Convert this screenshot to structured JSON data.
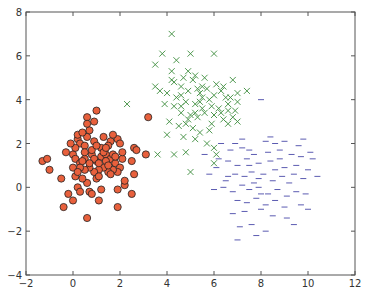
{
  "chart_data": {
    "type": "scatter",
    "title": "",
    "xlabel": "",
    "ylabel": "",
    "xlim": [
      -2,
      12
    ],
    "ylim": [
      -4,
      8
    ],
    "xticks": [
      -2,
      0,
      2,
      4,
      6,
      8,
      10,
      12
    ],
    "yticks": [
      -4,
      -2,
      0,
      2,
      4,
      6,
      8
    ],
    "xtick_labels": [
      "−2",
      "0",
      "2",
      "4",
      "6",
      "8",
      "10",
      "12"
    ],
    "ytick_labels": [
      "−4",
      "−2",
      "0",
      "2",
      "4",
      "6",
      "8"
    ],
    "grid": false,
    "legend": null,
    "series": [
      {
        "name": "cluster-1",
        "marker": "o",
        "color": "#e8603c",
        "edgecolor": "#222222",
        "points": [
          [
            -1.3,
            1.2
          ],
          [
            -1.1,
            1.3
          ],
          [
            -1.0,
            0.8
          ],
          [
            -0.5,
            0.4
          ],
          [
            -0.4,
            -0.9
          ],
          [
            -0.2,
            -0.3
          ],
          [
            0.0,
            -0.6
          ],
          [
            0.2,
            0.0
          ],
          [
            0.3,
            -0.2
          ],
          [
            0.1,
            0.5
          ],
          [
            0.6,
            0.2
          ],
          [
            0.7,
            -0.2
          ],
          [
            0.8,
            -0.3
          ],
          [
            1.1,
            -0.6
          ],
          [
            1.2,
            -0.1
          ],
          [
            0.6,
            -1.4
          ],
          [
            1.9,
            -0.1
          ],
          [
            1.9,
            -0.9
          ],
          [
            2.2,
            0.1
          ],
          [
            2.5,
            -0.3
          ],
          [
            2.2,
            0.3
          ],
          [
            2.6,
            0.6
          ],
          [
            0.0,
            1.5
          ],
          [
            0.1,
            1.3
          ],
          [
            0.3,
            1.1
          ],
          [
            0.5,
            1.3
          ],
          [
            0.8,
            1.5
          ],
          [
            1.0,
            1.2
          ],
          [
            1.2,
            1.4
          ],
          [
            1.4,
            1.5
          ],
          [
            1.6,
            1.3
          ],
          [
            1.8,
            1.1
          ],
          [
            2.0,
            0.9
          ],
          [
            1.9,
            0.7
          ],
          [
            1.7,
            0.8
          ],
          [
            1.5,
            0.7
          ],
          [
            1.3,
            0.9
          ],
          [
            1.1,
            0.8
          ],
          [
            0.9,
            0.7
          ],
          [
            0.7,
            0.9
          ],
          [
            0.5,
            0.8
          ],
          [
            0.3,
            0.9
          ],
          [
            0.0,
            0.9
          ],
          [
            0.2,
            0.7
          ],
          [
            0.4,
            0.4
          ],
          [
            1.0,
            0.4
          ],
          [
            1.1,
            0.5
          ],
          [
            1.6,
            0.6
          ],
          [
            2.5,
            1.2
          ],
          [
            2.1,
            1.3
          ],
          [
            0.2,
            2.2
          ],
          [
            0.3,
            2.0
          ],
          [
            0.5,
            1.9
          ],
          [
            0.6,
            2.3
          ],
          [
            0.9,
            2.1
          ],
          [
            1.3,
            2.3
          ],
          [
            1.6,
            2.1
          ],
          [
            1.9,
            2.2
          ],
          [
            2.0,
            2.0
          ],
          [
            1.5,
            1.9
          ],
          [
            1.2,
            1.8
          ],
          [
            0.8,
            1.7
          ],
          [
            0.5,
            1.6
          ],
          [
            0.1,
            1.8
          ],
          [
            -0.1,
            2.0
          ],
          [
            0.2,
            2.4
          ],
          [
            0.4,
            2.5
          ],
          [
            0.7,
            2.6
          ],
          [
            0.9,
            3.0
          ],
          [
            1.0,
            3.5
          ],
          [
            0.6,
            3.2
          ],
          [
            0.6,
            2.9
          ],
          [
            2.6,
            1.8
          ],
          [
            2.7,
            1.7
          ],
          [
            3.1,
            1.5
          ],
          [
            3.2,
            3.2
          ],
          [
            1.7,
            1.5
          ],
          [
            1.4,
            1.2
          ],
          [
            0.9,
            1.3
          ],
          [
            0.7,
            1.1
          ],
          [
            1.0,
            1.9
          ],
          [
            1.3,
            1.6
          ],
          [
            1.1,
            1.1
          ],
          [
            1.5,
            1.0
          ],
          [
            1.8,
            1.4
          ],
          [
            0.4,
            1.2
          ],
          [
            -0.3,
            1.6
          ],
          [
            1.7,
            2.4
          ],
          [
            2.1,
            1.6
          ],
          [
            1.4,
            1.8
          ]
        ]
      },
      {
        "name": "cluster-2",
        "marker": "x",
        "color": "#3c8c3c",
        "points": [
          [
            4.2,
            7.0
          ],
          [
            3.8,
            6.1
          ],
          [
            4.4,
            5.8
          ],
          [
            5.0,
            6.1
          ],
          [
            6.0,
            6.1
          ],
          [
            3.5,
            5.6
          ],
          [
            4.2,
            5.3
          ],
          [
            4.7,
            5.0
          ],
          [
            5.2,
            5.1
          ],
          [
            6.1,
            4.7
          ],
          [
            5.5,
            4.6
          ],
          [
            6.3,
            4.4
          ],
          [
            7.0,
            4.3
          ],
          [
            6.8,
            4.9
          ],
          [
            4.3,
            4.8
          ],
          [
            4.6,
            4.6
          ],
          [
            4.9,
            4.4
          ],
          [
            5.4,
            4.3
          ],
          [
            5.7,
            4.5
          ],
          [
            6.0,
            4.2
          ],
          [
            6.5,
            4.1
          ],
          [
            3.7,
            4.4
          ],
          [
            4.0,
            4.3
          ],
          [
            4.4,
            4.1
          ],
          [
            4.8,
            3.9
          ],
          [
            5.2,
            3.8
          ],
          [
            5.5,
            3.6
          ],
          [
            5.9,
            3.7
          ],
          [
            6.2,
            3.6
          ],
          [
            6.6,
            3.8
          ],
          [
            6.9,
            3.5
          ],
          [
            7.0,
            3.9
          ],
          [
            3.5,
            4.6
          ],
          [
            3.9,
            3.8
          ],
          [
            4.3,
            3.7
          ],
          [
            4.6,
            3.4
          ],
          [
            5.0,
            3.3
          ],
          [
            5.3,
            3.2
          ],
          [
            5.6,
            3.4
          ],
          [
            6.0,
            3.3
          ],
          [
            6.4,
            3.1
          ],
          [
            6.8,
            3.2
          ],
          [
            7.0,
            3.0
          ],
          [
            6.6,
            2.9
          ],
          [
            4.1,
            3.0
          ],
          [
            4.5,
            2.8
          ],
          [
            4.8,
            2.9
          ],
          [
            5.1,
            2.7
          ],
          [
            5.4,
            2.5
          ],
          [
            5.8,
            2.6
          ],
          [
            4.0,
            2.4
          ],
          [
            4.7,
            2.3
          ],
          [
            5.2,
            2.2
          ],
          [
            5.7,
            2.0
          ],
          [
            6.0,
            1.8
          ],
          [
            6.1,
            1.5
          ],
          [
            4.3,
            1.5
          ],
          [
            4.8,
            1.6
          ],
          [
            6.0,
            1.1
          ],
          [
            5.0,
            0.7
          ],
          [
            2.3,
            3.8
          ],
          [
            3.6,
            1.5
          ],
          [
            4.9,
            5.3
          ],
          [
            5.1,
            4.9
          ],
          [
            5.5,
            4.1
          ],
          [
            4.6,
            3.7
          ],
          [
            5.8,
            4.0
          ],
          [
            6.3,
            3.4
          ],
          [
            6.7,
            4.1
          ],
          [
            5.3,
            4.5
          ],
          [
            4.2,
            4.9
          ],
          [
            5.6,
            5.0
          ],
          [
            6.4,
            4.6
          ],
          [
            7.4,
            4.4
          ],
          [
            4.6,
            4.2
          ],
          [
            5.2,
            3.4
          ],
          [
            5.9,
            2.9
          ],
          [
            6.6,
            3.5
          ],
          [
            4.9,
            3.1
          ],
          [
            5.4,
            3.9
          ]
        ]
      },
      {
        "name": "cluster-3",
        "marker": "_",
        "color": "#4848a8",
        "points": [
          [
            8.0,
            4.0
          ],
          [
            7.2,
            2.2
          ],
          [
            8.2,
            2.1
          ],
          [
            9.0,
            2.1
          ],
          [
            8.6,
            2.0
          ],
          [
            9.8,
            2.2
          ],
          [
            6.7,
            1.7
          ],
          [
            7.2,
            1.8
          ],
          [
            7.5,
            1.7
          ],
          [
            7.7,
            1.5
          ],
          [
            8.3,
            1.6
          ],
          [
            8.8,
            1.7
          ],
          [
            9.3,
            1.5
          ],
          [
            9.7,
            1.4
          ],
          [
            10.2,
            1.3
          ],
          [
            6.2,
            1.3
          ],
          [
            6.6,
            1.2
          ],
          [
            7.0,
            1.0
          ],
          [
            7.4,
            1.3
          ],
          [
            7.9,
            1.1
          ],
          [
            8.4,
            1.2
          ],
          [
            8.6,
            0.8
          ],
          [
            9.0,
            0.9
          ],
          [
            9.5,
            1.0
          ],
          [
            10.0,
            0.8
          ],
          [
            5.8,
            0.6
          ],
          [
            6.1,
            0.9
          ],
          [
            6.5,
            0.3
          ],
          [
            6.9,
            0.6
          ],
          [
            7.3,
            0.5
          ],
          [
            7.6,
            0.7
          ],
          [
            7.9,
            0.4
          ],
          [
            8.1,
            0.6
          ],
          [
            8.5,
            0.3
          ],
          [
            8.9,
            0.5
          ],
          [
            9.2,
            0.2
          ],
          [
            9.8,
            0.4
          ],
          [
            10.4,
            0.5
          ],
          [
            6.0,
            -0.1
          ],
          [
            6.4,
            0.0
          ],
          [
            6.8,
            -0.2
          ],
          [
            7.2,
            0.1
          ],
          [
            7.5,
            -0.1
          ],
          [
            7.9,
            0.0
          ],
          [
            8.3,
            -0.3
          ],
          [
            8.7,
            -0.1
          ],
          [
            9.1,
            -0.4
          ],
          [
            9.5,
            -0.2
          ],
          [
            9.9,
            -0.3
          ],
          [
            7.0,
            -0.6
          ],
          [
            7.4,
            -0.7
          ],
          [
            7.8,
            -0.5
          ],
          [
            8.2,
            -0.8
          ],
          [
            8.6,
            -0.6
          ],
          [
            9.0,
            -0.9
          ],
          [
            9.7,
            -0.8
          ],
          [
            6.8,
            -1.2
          ],
          [
            7.3,
            -1.1
          ],
          [
            8.0,
            -1.0
          ],
          [
            8.5,
            -1.3
          ],
          [
            9.1,
            -1.4
          ],
          [
            7.1,
            -1.8
          ],
          [
            7.6,
            -1.7
          ],
          [
            8.2,
            -2.0
          ],
          [
            7.8,
            -2.2
          ],
          [
            7.0,
            -2.4
          ],
          [
            9.4,
            -1.7
          ],
          [
            5.6,
            1.5
          ],
          [
            6.3,
            2.0
          ],
          [
            10.0,
            -1.0
          ],
          [
            8.8,
            1.3
          ],
          [
            9.4,
            0.6
          ],
          [
            7.7,
            0.2
          ],
          [
            8.0,
            -0.3
          ],
          [
            6.6,
            0.5
          ],
          [
            9.6,
            1.9
          ],
          [
            10.1,
            1.6
          ],
          [
            8.4,
            2.3
          ],
          [
            6.9,
            2.0
          ],
          [
            7.5,
            1.0
          ]
        ]
      }
    ]
  }
}
